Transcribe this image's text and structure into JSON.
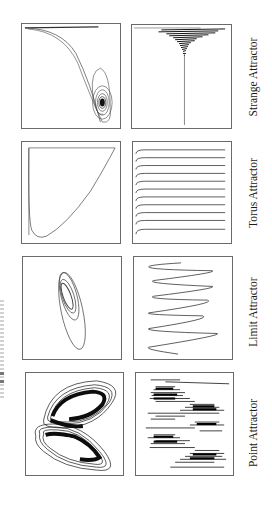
{
  "figure": {
    "rows": [
      {
        "label": "Strange Attractor",
        "phase_panel": "strange-phase-portrait",
        "time_panel": "strange-time-series"
      },
      {
        "label": "Torus Attractor",
        "phase_panel": "torus-phase-portrait",
        "time_panel": "torus-time-series"
      },
      {
        "label": "Limit Attractor",
        "phase_panel": "limit-phase-portrait",
        "time_panel": "limit-time-series"
      },
      {
        "label": "Point Attractor",
        "phase_panel": "point-phase-portrait",
        "time_panel": "point-time-series"
      }
    ],
    "colors": {
      "ink": "#1a1a1a",
      "frame": "#6a6a6a",
      "background": "#ffffff"
    },
    "orientation": "rotated 90 degrees counter-clockwise"
  }
}
